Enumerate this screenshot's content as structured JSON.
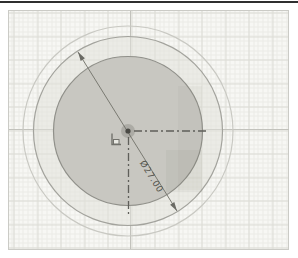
{
  "app": {
    "view": "sketch-viewport",
    "description": "CAD sketch of concentric circles with diameter dimension"
  },
  "sketch": {
    "dimension": {
      "label": "Ø27.00",
      "type": "diameter",
      "value": 27.0,
      "target": "middle-circle"
    },
    "entities": {
      "circles": [
        {
          "name": "outer-circle",
          "style": "thin-light-outline"
        },
        {
          "name": "middle-circle",
          "style": "outline-dimensioned"
        },
        {
          "name": "inner-profile-circle",
          "style": "shaded-profile"
        }
      ],
      "centerlines": [
        "horizontal-dash-dot-right-of-center",
        "vertical-dash-dot-below-center"
      ],
      "icons": [
        "center-point",
        "fixed-constraint-icon"
      ]
    }
  },
  "colors": {
    "background": "#f7f7f4",
    "grid_minor": "#eaeae6",
    "grid_major": "#dcdcd6",
    "axis": "#c2c2bc",
    "outer_circle_stroke": "#c9c9c3",
    "middle_circle_stroke": "#a3a39d",
    "inner_circle_stroke": "#90908a",
    "profile_fill": "#c8c7c1",
    "ring_fill": "#e9e8e3",
    "dimension": "#6a6a64",
    "centerline": "#5f5f5a",
    "top_divider": "#2f2f2f"
  }
}
